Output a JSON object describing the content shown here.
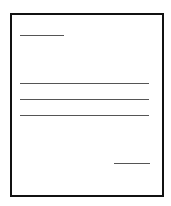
{
  "icon": {
    "name": "document-letter-icon",
    "description": "Blank letter/document outline with placeholder text lines",
    "border_color": "#111111",
    "line_color": "#555555",
    "lines": [
      {
        "role": "heading",
        "x": 20,
        "y": 35,
        "width": 44
      },
      {
        "role": "body-line-1",
        "x": 20,
        "y": 83,
        "width": 129
      },
      {
        "role": "body-line-2",
        "x": 20,
        "y": 99,
        "width": 129
      },
      {
        "role": "body-line-3",
        "x": 20,
        "y": 115,
        "width": 129
      },
      {
        "role": "signature",
        "x": 114,
        "y": 163,
        "width": 36
      }
    ]
  }
}
